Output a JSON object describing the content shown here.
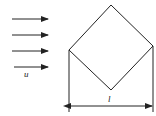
{
  "diagram": {
    "flow": {
      "label": "u",
      "arrow_count": 4,
      "direction": "left-to-right"
    },
    "body": {
      "shape": "square rotated 45 degrees"
    },
    "dimension": {
      "label": "l",
      "meaning": "width of diamond (corner to corner)"
    },
    "colors": {
      "line": "#222222",
      "background": "#ffffff"
    }
  }
}
